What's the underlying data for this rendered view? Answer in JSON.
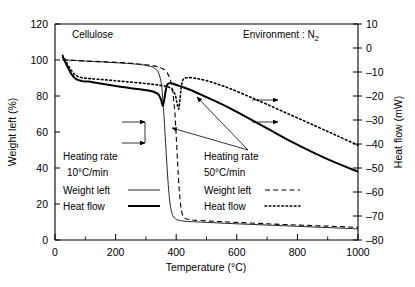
{
  "chart_data": {
    "type": "line",
    "title": "",
    "sample_label": "Cellulose",
    "environment_label": "Environment : N₂",
    "xlabel": "Temperature (°C)",
    "ylabel_left": "Weight left (%)",
    "ylabel_right": "Heat flow (mW)",
    "xlim": [
      0,
      1000
    ],
    "xticks": [
      0,
      200,
      400,
      600,
      800,
      1000
    ],
    "xtick_labels": [
      "0",
      "200",
      "400",
      "600",
      "800",
      "1000"
    ],
    "x_minor_ticks": [
      100,
      300,
      500,
      700,
      900
    ],
    "ylim_left": [
      0,
      120
    ],
    "yticks_left": [
      0,
      20,
      40,
      60,
      80,
      100,
      120
    ],
    "ytick_labels_left": [
      "0",
      "20",
      "40",
      "60",
      "80",
      "100",
      "120"
    ],
    "ylim_right": [
      -80,
      10
    ],
    "yticks_right": [
      10,
      0,
      -10,
      -20,
      -30,
      -40,
      -50,
      -60,
      -70,
      -80
    ],
    "ytick_labels_right": [
      "10",
      "0",
      "–10",
      "–20",
      "–30",
      "–40",
      "–50",
      "–60",
      "–70",
      "–80"
    ],
    "grid": false,
    "legend_position": "inside-lower-left and inside-lower-right",
    "series": [
      {
        "name": "Weight left 10°C/min",
        "axis": "left",
        "style": "solid-thin",
        "x": [
          25,
          60,
          90,
          120,
          160,
          200,
          240,
          280,
          300,
          320,
          330,
          340,
          350,
          355,
          360,
          365,
          370,
          375,
          380,
          385,
          390,
          400,
          420,
          450,
          500,
          600,
          700,
          800,
          900,
          1000
        ],
        "y": [
          100,
          99.8,
          99.5,
          99.2,
          98.9,
          98.5,
          98.1,
          97.5,
          97.0,
          96.2,
          95.2,
          93.5,
          88.0,
          80.0,
          68.0,
          54.0,
          40.0,
          28.0,
          20.0,
          15.5,
          13.2,
          11.5,
          10.6,
          10.2,
          9.8,
          9.0,
          8.3,
          7.6,
          6.9,
          6.2
        ]
      },
      {
        "name": "Weight left 50°C/min",
        "axis": "left",
        "style": "dashed",
        "x": [
          25,
          60,
          100,
          150,
          200,
          250,
          300,
          330,
          350,
          370,
          385,
          395,
          400,
          405,
          410,
          415,
          420,
          430,
          450,
          480,
          520,
          560,
          600,
          700,
          800,
          900,
          1000
        ],
        "y": [
          100,
          99.8,
          99.5,
          99.1,
          98.7,
          98.2,
          97.4,
          96.6,
          95.6,
          93.0,
          86.0,
          72.0,
          58.0,
          42.0,
          28.0,
          19.0,
          14.5,
          12.0,
          11.2,
          10.8,
          10.4,
          10.1,
          9.8,
          9.0,
          8.3,
          7.7,
          7.0
        ]
      },
      {
        "name": "Heat flow 10°C/min",
        "axis": "right",
        "style": "solid-thick",
        "x": [
          25,
          40,
          55,
          70,
          90,
          110,
          140,
          180,
          230,
          280,
          320,
          340,
          350,
          355,
          360,
          365,
          370,
          375,
          380,
          390,
          400,
          420,
          450,
          500,
          560,
          620,
          700,
          780,
          860,
          930,
          1000
        ],
        "y": [
          -3.5,
          -7.5,
          -11.0,
          -13.0,
          -13.8,
          -14.0,
          -14.6,
          -15.4,
          -16.4,
          -17.2,
          -18.0,
          -19.2,
          -21.5,
          -24.0,
          -22.0,
          -18.0,
          -15.5,
          -14.8,
          -14.6,
          -14.9,
          -15.4,
          -16.2,
          -17.6,
          -20.5,
          -24.0,
          -28.0,
          -33.5,
          -39.0,
          -44.0,
          -48.0,
          -51.5
        ]
      },
      {
        "name": "Heat flow 50°C/min",
        "axis": "right",
        "style": "dotted",
        "x": [
          25,
          40,
          55,
          70,
          90,
          120,
          170,
          230,
          300,
          350,
          380,
          395,
          402,
          408,
          412,
          416,
          420,
          425,
          435,
          450,
          470,
          500,
          540,
          580,
          640,
          700,
          780,
          860,
          930,
          1000
        ],
        "y": [
          -3.0,
          -6.5,
          -9.5,
          -11.5,
          -12.4,
          -12.8,
          -13.3,
          -14.0,
          -14.8,
          -15.6,
          -16.6,
          -19.0,
          -22.5,
          -25.5,
          -22.0,
          -17.0,
          -14.0,
          -12.8,
          -12.4,
          -12.4,
          -12.8,
          -13.6,
          -15.2,
          -17.0,
          -20.2,
          -23.5,
          -28.0,
          -32.5,
          -36.5,
          -40.5
        ]
      }
    ]
  },
  "annotations": {
    "sample": "Cellulose",
    "environment": "Environment : N",
    "environment_sub": "2",
    "legend_left": {
      "line1": "Heating rate",
      "line2": "10°C/min",
      "weight_label": "Weight left",
      "heat_label": "Heat flow"
    },
    "legend_right": {
      "line1": "Heating rate",
      "line2": "50°C/min",
      "weight_label": "Weight left",
      "heat_label": "Heat flow"
    }
  },
  "axes": {
    "x_title": "Temperature (°C)",
    "y_left_title": "Weight left (%)",
    "y_right_title": "Heat flow (mW)"
  },
  "colors": {
    "ink": "#000000",
    "background": "#ffffff"
  }
}
